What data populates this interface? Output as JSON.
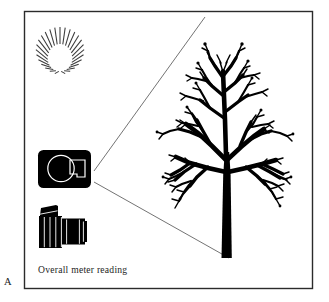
{
  "figure": {
    "panel_label": "A",
    "caption": "Overall meter reading",
    "border_color": "#2b2b2b",
    "ink_color": "#000000",
    "background_color": "#ffffff",
    "line_color": "#555555",
    "frame": {
      "x": 24,
      "y": 11,
      "width": 289,
      "height": 278
    },
    "elements": [
      {
        "name": "sun-starburst",
        "type": "icon",
        "rays": 20,
        "center_x": 60,
        "center_y": 53,
        "inner_radius": 9,
        "outer_radius": 26
      },
      {
        "name": "camera-front-body",
        "type": "icon",
        "x": 38,
        "y": 150,
        "width": 53,
        "height": 38
      },
      {
        "name": "camera-side-slr",
        "type": "icon",
        "x": 38,
        "y": 205,
        "width": 47,
        "height": 44
      },
      {
        "name": "view-cone-upper-line",
        "type": "line",
        "x1": 95,
        "y1": 172,
        "x2": 205,
        "y2": 18
      },
      {
        "name": "view-cone-lower-line",
        "type": "line",
        "x1": 95,
        "y1": 182,
        "x2": 228,
        "y2": 258
      },
      {
        "name": "bare-tree",
        "type": "silhouette",
        "canopy_x": 145,
        "canopy_y": 28,
        "canopy_width": 168,
        "canopy_height": 150,
        "trunk_top": 150,
        "trunk_bottom": 258
      }
    ]
  }
}
